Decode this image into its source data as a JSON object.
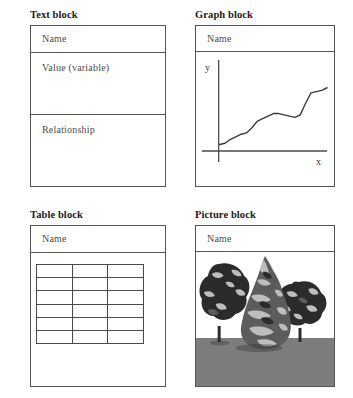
{
  "page": {
    "background_color": "#ffffff",
    "border_color": "#555555",
    "text_color": "#4b4b4b",
    "title_color": "#1a1a1a"
  },
  "blocks": [
    {
      "id": "text-block",
      "title": "Text block",
      "rows": [
        {
          "label": "Name"
        },
        {
          "label": "Value (variable)"
        },
        {
          "label": "Relationship"
        }
      ]
    },
    {
      "id": "graph-block",
      "title": "Graph block",
      "name_label": "Name",
      "graph": {
        "x_axis_label": "x",
        "y_axis_label": "y",
        "curve_color": "#3b3b3b",
        "axis_color": "#4a4a4a"
      }
    },
    {
      "id": "table-block",
      "title": "Table block",
      "name_label": "Name",
      "table": {
        "columns": 3,
        "rows": 6,
        "cells": [
          [
            "",
            "",
            ""
          ],
          [
            "",
            "",
            ""
          ],
          [
            "",
            "",
            ""
          ],
          [
            "",
            "",
            ""
          ],
          [
            "",
            "",
            ""
          ],
          [
            "",
            "",
            ""
          ]
        ]
      }
    },
    {
      "id": "picture-block",
      "title": "Picture block",
      "name_label": "Name",
      "picture": {
        "description": "grayscale photo of trees on gray ground",
        "sky_color": "#ffffff",
        "ground_color": "#7d7d7d",
        "foliage_dark": "#2b2b2b",
        "foliage_mid": "#5c5c5c",
        "foliage_light": "#bdbdbd"
      }
    }
  ],
  "chart_data": {
    "type": "line",
    "title": "",
    "xlabel": "x",
    "ylabel": "y",
    "grid": false,
    "legend": null,
    "xlim": [
      0,
      100
    ],
    "ylim": [
      0,
      100
    ],
    "x": [
      0,
      5,
      10,
      15,
      20,
      25,
      30,
      35,
      40,
      45,
      50,
      55,
      60,
      65,
      70,
      75,
      80,
      85,
      90,
      95,
      100
    ],
    "y": [
      30,
      31,
      34,
      36,
      38,
      39,
      43,
      48,
      50,
      52,
      54,
      54,
      53,
      52,
      51,
      53,
      62,
      70,
      71,
      72,
      74
    ]
  }
}
